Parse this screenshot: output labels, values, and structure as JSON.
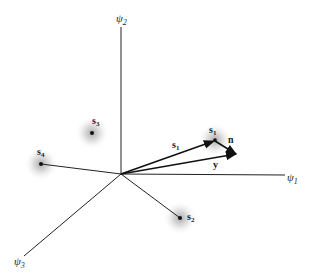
{
  "diagram": {
    "axes": {
      "psi1": {
        "base": "ψ",
        "sub": "1"
      },
      "psi2": {
        "base": "ψ",
        "sub": "2"
      },
      "psi3": {
        "base": "ψ",
        "sub": "3"
      }
    },
    "points": {
      "s1": {
        "base": "s",
        "sub": "1"
      },
      "s2": {
        "base": "s",
        "sub": "2"
      },
      "s3": {
        "base": "s",
        "sub": "3"
      },
      "s4": {
        "base": "s",
        "sub": "4"
      }
    },
    "vectors": {
      "s1": {
        "base": "s",
        "sub": "1"
      },
      "y": {
        "label": "y"
      },
      "n": {
        "label": "n"
      }
    },
    "colors": {
      "line": "#222222",
      "point": "#111111",
      "halo": "#9a9a9a"
    }
  }
}
